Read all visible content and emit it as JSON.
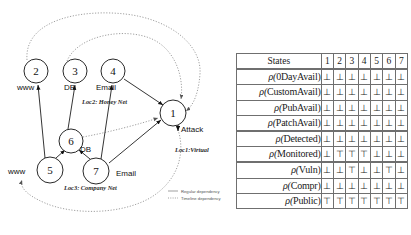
{
  "figure": {
    "graph": {
      "nodes": [
        {
          "id": "node-1",
          "label": "1",
          "cx": 173,
          "cy": 113,
          "r": 13
        },
        {
          "id": "node-2",
          "label": "2",
          "cx": 36,
          "cy": 71,
          "r": 12
        },
        {
          "id": "node-3",
          "label": "3",
          "cx": 75,
          "cy": 71,
          "r": 12
        },
        {
          "id": "node-4",
          "label": "4",
          "cx": 113,
          "cy": 71,
          "r": 12
        },
        {
          "id": "node-5",
          "label": "5",
          "cx": 50,
          "cy": 170,
          "r": 13
        },
        {
          "id": "node-6",
          "label": "6",
          "cx": 71,
          "cy": 141,
          "r": 12
        },
        {
          "id": "node-7",
          "label": "7",
          "cx": 96,
          "cy": 171,
          "r": 13
        }
      ],
      "service_labels": [
        {
          "name": "www-label-top",
          "text": "www",
          "x": 17,
          "y": 90
        },
        {
          "name": "db-label-top",
          "text": "DB",
          "x": 64,
          "y": 90
        },
        {
          "name": "email-label-top",
          "text": "Email",
          "x": 96,
          "y": 90
        },
        {
          "name": "www-label-bottom",
          "text": "www",
          "x": 8,
          "y": 174
        },
        {
          "name": "db-label-mid",
          "text": "DB",
          "x": 80,
          "y": 152
        },
        {
          "name": "email-label-bottom",
          "text": "Email",
          "x": 116,
          "y": 176
        }
      ],
      "location_labels": [
        {
          "name": "loc2-honeynet",
          "text": "Loc2: Honey Net",
          "x": 82,
          "y": 104
        },
        {
          "name": "loc1-virtual",
          "text": "Loc1:Virtual",
          "x": 175,
          "y": 152
        },
        {
          "name": "loc3-companynet",
          "text": "Loc3: Company Net",
          "x": 64,
          "y": 190
        }
      ],
      "attack_label": {
        "text": "Attack",
        "x": 180,
        "y": 131
      },
      "legend": [
        {
          "name": "legend-regular",
          "text": "Regular dependency",
          "style": "solid"
        },
        {
          "name": "legend-timeline",
          "text": "Timeline dependency",
          "style": "dotted"
        }
      ]
    },
    "table": {
      "header": {
        "states_label": "States",
        "columns": [
          "1",
          "2",
          "3",
          "4",
          "5",
          "6",
          "7"
        ]
      },
      "groups": [
        {
          "rows": [
            {
              "name": "0DayAvail",
              "prefix": "ρ(",
              "suffix": ")",
              "values": [
                "⊥",
                "⊥",
                "⊥",
                "⊥",
                "⊥",
                "⊥",
                "⊥"
              ]
            },
            {
              "name": "CustomAvail",
              "prefix": "ρ(",
              "suffix": ")",
              "values": [
                "⊥",
                "⊥",
                "⊥",
                "⊥",
                "⊥",
                "⊥",
                "⊥"
              ]
            },
            {
              "name": "PubAvail",
              "prefix": "ρ(",
              "suffix": ")",
              "values": [
                "⊥",
                "⊥",
                "⊥",
                "⊥",
                "⊥",
                "⊥",
                "⊥"
              ]
            },
            {
              "name": "PatchAvail",
              "prefix": "ρ(",
              "suffix": ")",
              "values": [
                "⊥",
                "⊥",
                "⊥",
                "⊥",
                "⊥",
                "⊥",
                "⊥"
              ]
            }
          ]
        },
        {
          "rows": [
            {
              "name": "Detected",
              "prefix": "ρ(",
              "suffix": ")",
              "values": [
                "⊥",
                "⊥",
                "⊥",
                "⊥",
                "⊥",
                "⊥",
                "⊥"
              ]
            },
            {
              "name": "Monitored",
              "prefix": "ρ(",
              "suffix": ")",
              "values": [
                "⊥",
                "⊤",
                "⊤",
                "⊤",
                "⊥",
                "⊥",
                "⊥"
              ]
            }
          ]
        },
        {
          "rows": [
            {
              "name": "Vuln",
              "prefix": "ρ(",
              "suffix": ")",
              "values": [
                "⊥",
                "⊥",
                "⊤",
                "⊥",
                "⊥",
                "⊤",
                "⊥"
              ]
            },
            {
              "name": "Compr",
              "prefix": "ρ(",
              "suffix": ")",
              "values": [
                "⊥",
                "⊥",
                "⊥",
                "⊥",
                "⊥",
                "⊥",
                "⊥"
              ]
            },
            {
              "name": "Public",
              "prefix": "ρ(",
              "suffix": ")",
              "values": [
                "⊤",
                "⊤",
                "⊤",
                "⊤",
                "⊤",
                "⊤",
                "⊤"
              ]
            }
          ]
        }
      ]
    }
  }
}
